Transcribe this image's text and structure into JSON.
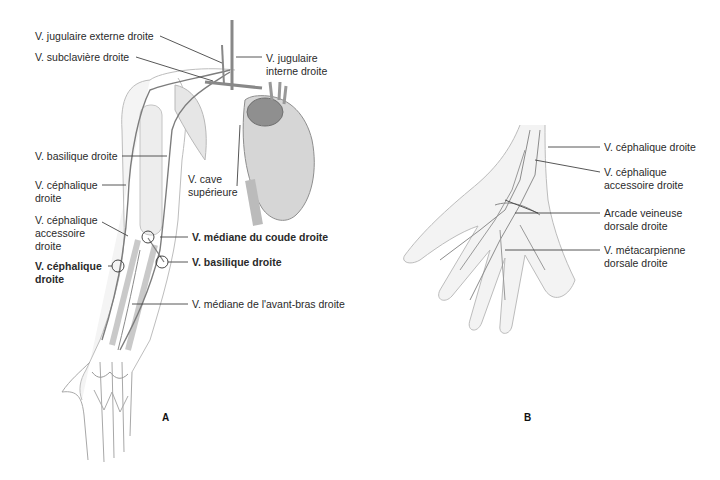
{
  "figure": {
    "panels": [
      {
        "id": "A",
        "letter": "A",
        "subject": "right upper limb superficial veins with heart",
        "labels": [
          {
            "text": "V. jugulaire externe droite",
            "bold": false
          },
          {
            "text": "V. subclavière droite",
            "bold": false
          },
          {
            "text": "V. jugulaire",
            "bold": false
          },
          {
            "text": "interne droite",
            "bold": false
          },
          {
            "text": "V. basilique droite",
            "bold": false
          },
          {
            "text": "V. céphalique",
            "bold": false
          },
          {
            "text": "droite",
            "bold": false
          },
          {
            "text": "V. cave",
            "bold": false
          },
          {
            "text": "supérieure",
            "bold": false
          },
          {
            "text": "V. céphalique",
            "bold": false
          },
          {
            "text": "accessoire",
            "bold": false
          },
          {
            "text": "droite",
            "bold": false
          },
          {
            "text": "V. médiane du coude droite",
            "bold": true
          },
          {
            "text": "V. céphalique",
            "bold": true
          },
          {
            "text": "droite",
            "bold": true
          },
          {
            "text": "V. basilique droite",
            "bold": true
          },
          {
            "text": "V. médiane de l'avant-bras droite",
            "bold": false
          }
        ]
      },
      {
        "id": "B",
        "letter": "B",
        "subject": "dorsal hand veins",
        "labels": [
          {
            "text": "V. céphalique droite"
          },
          {
            "text": "V. céphalique"
          },
          {
            "text": "accessoire droite"
          },
          {
            "text": "Arcade veineuse"
          },
          {
            "text": "dorsale droite"
          },
          {
            "text": "V. métacarpienne"
          },
          {
            "text": "dorsale droite"
          }
        ]
      }
    ]
  }
}
